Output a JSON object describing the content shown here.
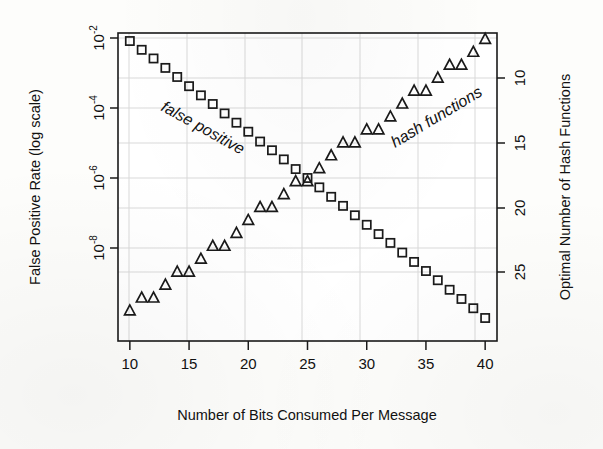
{
  "figure": {
    "title": "",
    "background_color": "#fdfdfb",
    "ink_color": "#1a1a1a",
    "grid_color": "#d9d9d9"
  },
  "axes": {
    "x": {
      "label": "Number of Bits Consumed Per Message",
      "ticks": [
        "10",
        "15",
        "20",
        "25",
        "30",
        "35",
        "40"
      ],
      "tick_values": [
        10,
        15,
        20,
        25,
        30,
        35,
        40
      ],
      "range": [
        9,
        41
      ]
    },
    "y_left": {
      "label": "False Positive Rate (log scale)",
      "ticks": [
        "10-2",
        "10-4",
        "10-6",
        "10-8"
      ],
      "tick_bases": [
        "10",
        "10",
        "10",
        "10"
      ],
      "tick_exponents": [
        "-2",
        "-4",
        "-6",
        "-8"
      ],
      "tick_values": [
        0.01,
        0.0001,
        1e-06,
        1e-08
      ],
      "scale": "log",
      "range": [
        4e-10,
        0.013
      ]
    },
    "y_right": {
      "label": "Optimal Number of Hash Functions",
      "ticks": [
        "10",
        "15",
        "20",
        "25"
      ],
      "tick_values": [
        10,
        15,
        20,
        25
      ],
      "scale": "linear",
      "range": [
        6,
        29
      ]
    }
  },
  "annotations": [
    {
      "name": "false-positive-label",
      "text": "false positive",
      "x": 15.2,
      "rotation": 29
    },
    {
      "name": "hash-functions-label",
      "text": "hash functions",
      "x": 33.6,
      "rotation": -31
    }
  ],
  "chart_data": {
    "type": "scatter",
    "title": "",
    "xlabel": "Number of Bits Consumed Per Message",
    "ylabel": "False Positive Rate (log scale)",
    "ylabel_right": "Optimal Number of Hash Functions",
    "xlim": [
      9,
      41
    ],
    "ylim_left": [
      4e-10,
      0.013
    ],
    "ylim_right": [
      6,
      29
    ],
    "grid": true,
    "legend": "inline-annotations",
    "x": [
      10,
      11,
      12,
      13,
      14,
      15,
      16,
      17,
      18,
      19,
      20,
      21,
      22,
      23,
      24,
      25,
      26,
      27,
      28,
      29,
      30,
      31,
      32,
      33,
      34,
      35,
      36,
      37,
      38,
      39,
      40
    ],
    "series": [
      {
        "name": "false positive",
        "axis": "left",
        "marker": "square",
        "values": [
          0.0082,
          0.0046,
          0.0026,
          0.0014,
          0.00077,
          0.00042,
          0.00023,
          0.00013,
          7e-05,
          3.8e-05,
          2.1e-05,
          1.1e-05,
          6.2e-06,
          3.4e-06,
          1.8e-06,
          1e-06,
          5.4e-07,
          2.9e-07,
          1.6e-07,
          8.6e-08,
          4.6e-08,
          2.5e-08,
          1.4e-08,
          7.4e-09,
          4e-09,
          2.2e-09,
          1.2e-09,
          6.4e-10,
          3.5e-10,
          1.9e-10,
          1e-10
        ]
      },
      {
        "name": "hash functions",
        "axis": "right",
        "marker": "triangle",
        "values": [
          7,
          8,
          8,
          9,
          10,
          10,
          11,
          12,
          12,
          13,
          14,
          15,
          15,
          16,
          17,
          17,
          18,
          19,
          20,
          20,
          21,
          21,
          22,
          23,
          24,
          24,
          25,
          26,
          26,
          27,
          28
        ]
      }
    ]
  }
}
